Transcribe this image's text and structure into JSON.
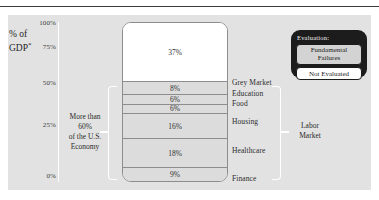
{
  "chart_data": {
    "type": "bar",
    "title": "",
    "ylabel": "% of GDP*",
    "ylim": [
      0,
      100
    ],
    "ytick_labels": [
      "100%",
      "75%",
      "50%",
      "25%",
      "0%"
    ],
    "ytick_values": [
      100,
      75,
      50,
      25,
      0
    ],
    "grid": false,
    "stacked": true,
    "categories": [
      "Grey Market",
      "Education",
      "Food",
      "Housing",
      "Healthcare",
      "Finance"
    ],
    "segments": [
      {
        "label": "",
        "value": 37,
        "value_label": "37%",
        "evaluation": "Not Evaluated"
      },
      {
        "label": "Grey Market",
        "value": 8,
        "value_label": "8%",
        "evaluation": "Fundamental Failures"
      },
      {
        "label": "Education",
        "value": 6,
        "value_label": "6%",
        "evaluation": "Fundamental Failures"
      },
      {
        "label": "Food",
        "value": 6,
        "value_label": "6%",
        "evaluation": "Fundamental Failures"
      },
      {
        "label": "Housing",
        "value": 16,
        "value_label": "16%",
        "evaluation": "Fundamental Failures"
      },
      {
        "label": "Healthcare",
        "value": 18,
        "value_label": "18%",
        "evaluation": "Fundamental Failures"
      },
      {
        "label": "Finance",
        "value": 9,
        "value_label": "9%",
        "evaluation": "Fundamental Failures"
      }
    ],
    "annotations": [
      {
        "name": "left-annotation",
        "text": "More than 60% of the U.S. Economy"
      },
      {
        "name": "right-bracket-label",
        "text": "Labor Market"
      }
    ],
    "legend": {
      "position": "top-right",
      "title": "Evaluation:",
      "entries": [
        {
          "label": "Fundamental Failures",
          "color": "#d3d3d3"
        },
        {
          "label": "Not Evaluated",
          "color": "#ffffff"
        }
      ]
    },
    "colors": {
      "panel_background": "#e2e2e2",
      "fundamental_failures": "#dcdcdc",
      "not_evaluated": "#ffffff",
      "bar_outline": "#8d8d8d",
      "legend_background": "#1c1c1c",
      "bracket": "#ffffff",
      "text": "#2b2b2b"
    }
  },
  "axis": {
    "title_line1": "% of",
    "title_line2": "GDP",
    "title_superscript": "*",
    "ticks": [
      {
        "label": "100%",
        "top": 19
      },
      {
        "label": "75%",
        "top": 43
      },
      {
        "label": "50%",
        "top": 79
      },
      {
        "label": "25%",
        "top": 121
      },
      {
        "label": "0%",
        "top": 172
      }
    ]
  },
  "annotations": {
    "left_line1": "More than 60%",
    "left_line2": "of the U.S.",
    "left_line3": "Economy",
    "labor_market_line1": "Labor",
    "labor_market_line2": "Market"
  },
  "legend": {
    "title": "Evaluation:",
    "fundamental_line1": "Fundamental",
    "fundamental_line2": "Failures",
    "not_evaluated": "Not Evaluated"
  },
  "bar_segments": [
    {
      "value_label": "37%",
      "pct": 37,
      "kind": "nf"
    },
    {
      "value_label": "8%",
      "pct": 8,
      "kind": "ff"
    },
    {
      "value_label": "6%",
      "pct": 6,
      "kind": "ff"
    },
    {
      "value_label": "6%",
      "pct": 6,
      "kind": "ff"
    },
    {
      "value_label": "16%",
      "pct": 16,
      "kind": "ff"
    },
    {
      "value_label": "18%",
      "pct": 18,
      "kind": "ff"
    },
    {
      "value_label": "9%",
      "pct": 9,
      "kind": "ff"
    }
  ],
  "category_labels": [
    {
      "text": "Grey Market",
      "top": 56
    },
    {
      "text": "Education",
      "top": 67
    },
    {
      "text": "Food",
      "top": 77
    },
    {
      "text": "Housing",
      "top": 95
    },
    {
      "text": "Healthcare",
      "top": 124
    },
    {
      "text": "Finance",
      "top": 152
    }
  ]
}
